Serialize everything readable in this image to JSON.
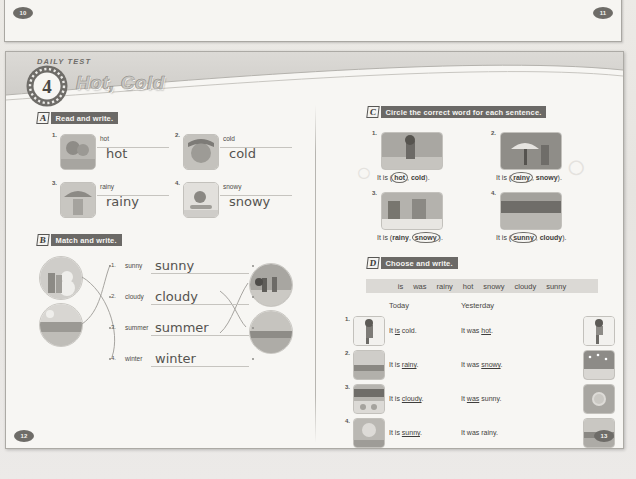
{
  "page_numbers": {
    "top_left": "10",
    "top_right": "11",
    "bottom_left": "12",
    "bottom_right": "13"
  },
  "header": {
    "kicker": "DAILY TEST",
    "number": "4",
    "title": "Hot, Cold"
  },
  "sections": {
    "a": {
      "letter": "A",
      "instruction": "Read and write.",
      "items": [
        {
          "num": "1.",
          "prompt": "hot",
          "answer": "hot",
          "image": "boy-in-sun"
        },
        {
          "num": "2.",
          "prompt": "cold",
          "answer": "cold",
          "image": "girl-in-snow-hat"
        },
        {
          "num": "3.",
          "prompt": "rainy",
          "answer": "rainy",
          "image": "kids-with-umbrella"
        },
        {
          "num": "4.",
          "prompt": "snowy",
          "answer": "snowy",
          "image": "child-sledding"
        }
      ]
    },
    "b": {
      "letter": "B",
      "instruction": "Match and write.",
      "items": [
        {
          "num": "1.",
          "prompt": "sunny",
          "answer": "sunny"
        },
        {
          "num": "2.",
          "prompt": "cloudy",
          "answer": "cloudy"
        },
        {
          "num": "3.",
          "prompt": "summer",
          "answer": "summer"
        },
        {
          "num": "4.",
          "prompt": "winter",
          "answer": "winter"
        }
      ],
      "left_images": [
        "kids-with-snowman",
        "beach-scene"
      ],
      "right_images": [
        "people-at-beach",
        "ocean-horizon"
      ]
    },
    "c": {
      "letter": "C",
      "instruction": "Circle the correct word for each sentence.",
      "items": [
        {
          "num": "1.",
          "lead": "It is (",
          "opt1": "hot",
          "sep": ", ",
          "opt2": "cold",
          "tail": ").",
          "circled": "opt1",
          "image": "boy-hot-sun"
        },
        {
          "num": "2.",
          "lead": "It is (",
          "opt1": "rainy",
          "sep": ", ",
          "opt2": "snowy",
          "tail": ").",
          "circled": "opt1",
          "image": "girls-umbrella-rain"
        },
        {
          "num": "3.",
          "lead": "It is (",
          "opt1": "rainy",
          "sep": ", ",
          "opt2": "snowy",
          "tail": ").",
          "circled": "opt2",
          "image": "snowy-street"
        },
        {
          "num": "4.",
          "lead": "It is (",
          "opt1": "sunny",
          "sep": ", ",
          "opt2": "cloudy",
          "tail": ").",
          "circled": "opt1",
          "image": "sunny-field"
        }
      ]
    },
    "d": {
      "letter": "D",
      "instruction": "Choose and write.",
      "wordbank": [
        "is",
        "was",
        "rainy",
        "hot",
        "snowy",
        "cloudy",
        "sunny"
      ],
      "col_today": "Today",
      "col_yesterday": "Yesterday",
      "rows": [
        {
          "num": "1.",
          "today_pre": "It ",
          "today_fill": "is",
          "today_post": " cold.",
          "yest_pre": "It was ",
          "yest_fill": "hot",
          "yest_post": ".",
          "image_left": "boy-cold-jacket",
          "image_right": "boy-hot-shorts"
        },
        {
          "num": "2.",
          "today_pre": "It is ",
          "today_fill": "rainy",
          "today_post": ".",
          "yest_pre": "It was ",
          "yest_fill": "snowy",
          "yest_post": ".",
          "image_left": "rainy-landscape",
          "image_right": "snowy-landscape"
        },
        {
          "num": "3.",
          "today_pre": "It is ",
          "today_fill": "cloudy",
          "today_post": ".",
          "yest_pre": "It ",
          "yest_fill": "was",
          "yest_post": " sunny.",
          "image_left": "cloudy-city",
          "image_right": "sunny-sky"
        },
        {
          "num": "4.",
          "today_pre": "It is ",
          "today_fill": "sunny",
          "today_post": ".",
          "yest_pre": "It was rainy",
          "yest_fill": "",
          "yest_post": ".",
          "image_left": "sunny-sky-2",
          "image_right": "rainy-landscape-2"
        }
      ]
    }
  },
  "colors": {
    "paper": "#f7f6f3",
    "ink": "#3f3e3c",
    "bar": "#6b6966",
    "rule": "#c6c4bf"
  }
}
